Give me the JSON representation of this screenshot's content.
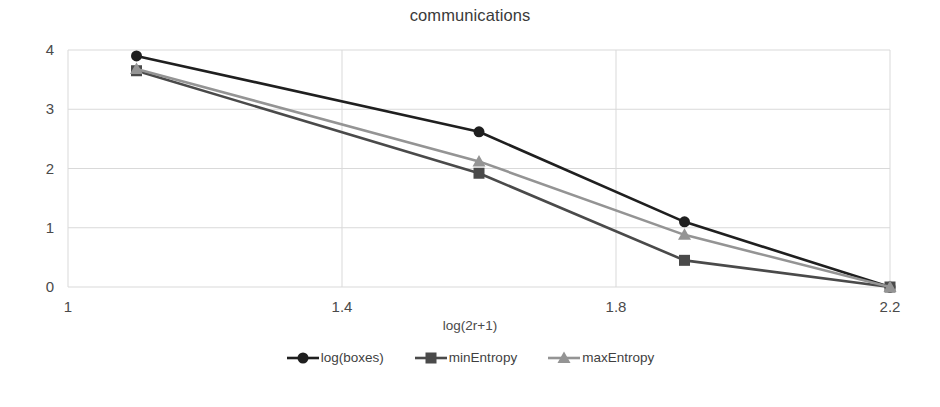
{
  "chart_data": {
    "type": "line",
    "title": "communications",
    "xlabel": "log(2r+1)",
    "ylabel": "",
    "x": [
      1.1,
      1.6,
      1.9,
      2.2
    ],
    "xlim": [
      1.0,
      2.2
    ],
    "ylim": [
      0,
      4
    ],
    "xticks": [
      "1",
      "1.4",
      "1.8",
      "2.2"
    ],
    "xtick_values": [
      1.0,
      1.4,
      1.8,
      2.2
    ],
    "yticks": [
      "0",
      "1",
      "2",
      "3",
      "4"
    ],
    "ytick_values": [
      0,
      1,
      2,
      3,
      4
    ],
    "grid": true,
    "legend_position": "bottom",
    "series": [
      {
        "name": "log(boxes)",
        "marker": "circle",
        "color": "#1f1f1f",
        "values": [
          3.9,
          2.62,
          1.1,
          0.0
        ]
      },
      {
        "name": "minEntropy",
        "marker": "square",
        "color": "#4a4a4a",
        "values": [
          3.65,
          1.92,
          0.45,
          0.0
        ]
      },
      {
        "name": "maxEntropy",
        "marker": "triangle",
        "color": "#949494",
        "values": [
          3.68,
          2.12,
          0.88,
          0.0
        ]
      }
    ]
  },
  "colors": {
    "grid": "#d9d9d9",
    "axis_text": "#4a4a4a",
    "title_text": "#3a3a3a",
    "background": "#ffffff"
  },
  "legend": {
    "items": [
      {
        "label": "log(boxes)"
      },
      {
        "label": "minEntropy"
      },
      {
        "label": "maxEntropy"
      }
    ]
  }
}
